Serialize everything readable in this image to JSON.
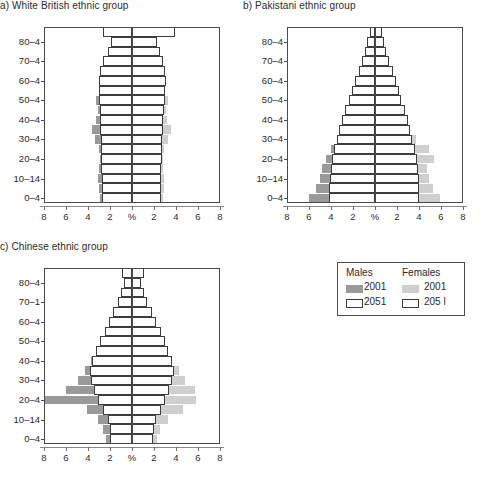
{
  "figure": {
    "panels": [
      {
        "key": "a",
        "title": "a) White British ethnic group"
      },
      {
        "key": "b",
        "title": "b) Pakistani ethnic group"
      },
      {
        "key": "c",
        "title": "c) Chinese ethnic group"
      }
    ]
  },
  "legend": {
    "males_header": "Males",
    "females_header": "Females",
    "males_2001": "2001",
    "males_2051": "2051",
    "females_2001": "2001",
    "females_2051": "205 l",
    "colors": {
      "male_2001": "#9a9a9a",
      "female_2001": "#cfcfcf",
      "male_2051": "#ffffff",
      "female_2051": "#ffffff",
      "outline": "#3d3d3d"
    }
  },
  "axes": {
    "x_ticks": [
      "8",
      "6",
      "4",
      "2",
      "%",
      "2",
      "4",
      "6",
      "8"
    ],
    "x_range": [
      -8,
      8
    ],
    "x_unit": "%",
    "y_labels_a": [
      "80–4",
      "70–4",
      "60–4",
      "50–4",
      "40–4",
      "30–4",
      "20–4",
      "10–14",
      "0–4"
    ],
    "y_labels_b": [
      "80–4",
      "70–4",
      "60–4",
      "50–4",
      "40–4",
      "30–4",
      "20–4",
      "10–14",
      "0–4"
    ],
    "y_labels_c": [
      "80–4",
      "70–1",
      "60–4",
      "50–4",
      "40–4",
      "30–4",
      "20–4",
      "10–14",
      "0–4"
    ],
    "age_groups": [
      "0–4",
      "5–9",
      "10–14",
      "15–19",
      "20–24",
      "25–29",
      "30–34",
      "35–39",
      "40–44",
      "45–49",
      "50–54",
      "55–59",
      "60–64",
      "65–69",
      "70–74",
      "75–79",
      "80–84",
      "85+"
    ]
  },
  "chart_data": [
    {
      "type": "bar",
      "title": "a) White British ethnic group",
      "xlabel": "%",
      "ylabel": "",
      "xlim": [
        -8,
        8
      ],
      "grid": false,
      "legend_position": "external",
      "categories": [
        "0–4",
        "5–9",
        "10–14",
        "15–19",
        "20–24",
        "25–29",
        "30–34",
        "35–39",
        "40–44",
        "45–49",
        "50–54",
        "55–59",
        "60–64",
        "65–69",
        "70–74",
        "75–79",
        "80–84",
        "85+"
      ],
      "series": [
        {
          "name": "Males 2001",
          "side": "left",
          "values": [
            2.9,
            3.0,
            3.1,
            3.0,
            2.9,
            3.0,
            3.4,
            3.6,
            3.3,
            3.1,
            3.3,
            2.9,
            2.6,
            2.2,
            2.0,
            1.5,
            1.0,
            0.6
          ]
        },
        {
          "name": "Females 2001",
          "side": "right",
          "values": [
            2.8,
            2.9,
            2.9,
            2.8,
            2.8,
            2.9,
            3.3,
            3.5,
            3.2,
            3.1,
            3.3,
            2.9,
            2.7,
            2.3,
            2.2,
            1.8,
            1.4,
            1.2
          ]
        },
        {
          "name": "Males 2051",
          "side": "left",
          "values": [
            2.7,
            2.7,
            2.7,
            2.8,
            2.8,
            2.8,
            2.8,
            2.9,
            2.9,
            2.9,
            3.0,
            3.0,
            3.0,
            2.9,
            2.6,
            2.2,
            1.9,
            2.6
          ]
        },
        {
          "name": "Females 2051",
          "side": "right",
          "values": [
            2.6,
            2.6,
            2.6,
            2.6,
            2.7,
            2.7,
            2.7,
            2.8,
            2.8,
            2.9,
            3.0,
            3.0,
            3.1,
            3.0,
            2.8,
            2.5,
            2.3,
            3.9
          ]
        }
      ]
    },
    {
      "type": "bar",
      "title": "b) Pakistani ethnic group",
      "xlabel": "%",
      "ylabel": "",
      "xlim": [
        -8,
        8
      ],
      "grid": false,
      "legend_position": "external",
      "categories": [
        "0–4",
        "5–9",
        "10–14",
        "15–19",
        "20–24",
        "25–29",
        "30–34",
        "35–39",
        "40–44",
        "45–49",
        "50–54",
        "55–59",
        "60–64",
        "65–69",
        "70–74",
        "75–79",
        "80–84",
        "85+"
      ],
      "series": [
        {
          "name": "Males 2001",
          "side": "left",
          "values": [
            6.0,
            5.4,
            5.0,
            4.8,
            4.5,
            4.0,
            3.4,
            2.9,
            2.5,
            2.1,
            1.8,
            1.4,
            1.2,
            0.9,
            0.7,
            0.4,
            0.3,
            0.2
          ]
        },
        {
          "name": "Females 2001",
          "side": "right",
          "values": [
            5.9,
            5.3,
            4.9,
            4.7,
            5.4,
            4.9,
            3.7,
            3.0,
            2.4,
            1.9,
            1.5,
            1.2,
            1.0,
            0.8,
            0.6,
            0.4,
            0.3,
            0.2
          ]
        },
        {
          "name": "Males 2051",
          "side": "left",
          "values": [
            4.2,
            4.2,
            4.1,
            4.0,
            3.9,
            3.7,
            3.5,
            3.3,
            3.0,
            2.7,
            2.4,
            2.1,
            1.8,
            1.5,
            1.2,
            0.9,
            0.7,
            0.5
          ]
        },
        {
          "name": "Females 2051",
          "side": "right",
          "values": [
            4.0,
            4.0,
            4.0,
            3.9,
            3.8,
            3.6,
            3.4,
            3.2,
            3.0,
            2.7,
            2.4,
            2.2,
            1.9,
            1.6,
            1.3,
            1.0,
            0.8,
            0.6
          ]
        }
      ]
    },
    {
      "type": "bar",
      "title": "c) Chinese ethnic group",
      "xlabel": "%",
      "ylabel": "",
      "xlim": [
        -8,
        8
      ],
      "grid": false,
      "legend_position": "external",
      "categories": [
        "0–4",
        "5–9",
        "10–14",
        "15–19",
        "20–24",
        "25–29",
        "30–34",
        "35–39",
        "40–44",
        "45–49",
        "50–54",
        "55–59",
        "60–64",
        "65–69",
        "70–74",
        "75–79",
        "80–84",
        "85+"
      ],
      "series": [
        {
          "name": "Males 2001",
          "side": "left",
          "values": [
            2.4,
            2.6,
            3.1,
            4.1,
            8.0,
            6.0,
            4.9,
            4.3,
            3.7,
            3.2,
            2.6,
            2.1,
            1.6,
            1.2,
            0.9,
            0.6,
            0.4,
            0.2
          ]
        },
        {
          "name": "Females 2001",
          "side": "right",
          "values": [
            2.3,
            2.5,
            3.3,
            4.6,
            5.8,
            5.7,
            4.8,
            4.3,
            3.6,
            3.0,
            2.4,
            1.9,
            1.5,
            1.1,
            0.8,
            0.5,
            0.3,
            0.2
          ]
        },
        {
          "name": "Males 2051",
          "side": "left",
          "values": [
            2.0,
            2.0,
            2.2,
            2.6,
            3.1,
            3.5,
            3.7,
            3.8,
            3.6,
            3.3,
            2.9,
            2.5,
            2.1,
            1.7,
            1.3,
            1.0,
            0.7,
            0.9
          ]
        },
        {
          "name": "Females 2051",
          "side": "right",
          "values": [
            1.9,
            2.0,
            2.2,
            2.6,
            3.0,
            3.4,
            3.6,
            3.8,
            3.6,
            3.3,
            3.0,
            2.6,
            2.2,
            1.8,
            1.4,
            1.1,
            0.8,
            1.1
          ]
        }
      ]
    }
  ]
}
